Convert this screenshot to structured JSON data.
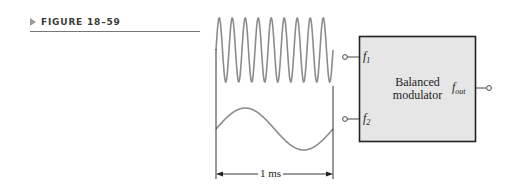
{
  "figure": {
    "label": "FIGURE 18–59",
    "marker_icon": "triangle-right-icon"
  },
  "waveforms": {
    "f1": {
      "description": "high-frequency sine",
      "cycles": 9,
      "color": "#8c8c8c"
    },
    "f2": {
      "description": "low-frequency sine",
      "cycles": 1,
      "color": "#8c8c8c"
    },
    "time_span_label": "1 ms"
  },
  "block": {
    "title_line1": "Balanced",
    "title_line2": "modulator",
    "fill": "#e6e6e6",
    "border": "#222222",
    "inputs": [
      {
        "label": "f",
        "sub": "1"
      },
      {
        "label": "f",
        "sub": "2"
      }
    ],
    "output": {
      "label": "f",
      "sub": "out"
    }
  }
}
